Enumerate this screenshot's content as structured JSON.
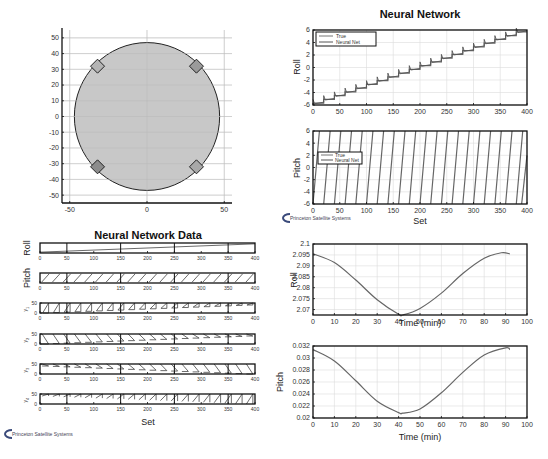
{
  "chart_data": [
    {
      "type": "scatter",
      "title": "",
      "xlabel": "",
      "ylabel": "",
      "xlim": [
        -55,
        55
      ],
      "ylim": [
        -55,
        55
      ],
      "xticks": [
        -50,
        0,
        50
      ],
      "yticks": [
        50,
        40,
        30,
        20,
        10,
        0,
        -10,
        -20,
        -30,
        -40,
        -50
      ],
      "grid": true,
      "shapes": {
        "circle": {
          "center": [
            0,
            0
          ],
          "radius": 47,
          "fill": "#c8c8c8"
        },
        "diamonds": [
          {
            "x": -32,
            "y": 32,
            "fill": "#b4b4b4"
          },
          {
            "x": 32,
            "y": 32,
            "fill": "#9a9a9a"
          },
          {
            "x": -32,
            "y": -32,
            "fill": "#8c8c8c"
          },
          {
            "x": 32,
            "y": -32,
            "fill": "#a8a8a8"
          }
        ]
      }
    },
    {
      "type": "line",
      "title": "Neural Network",
      "xlabel": "",
      "ylabel": "Roll",
      "xlim": [
        0,
        400
      ],
      "ylim": [
        -6,
        6
      ],
      "xticks": [
        0,
        50,
        100,
        150,
        200,
        250,
        300,
        350,
        400
      ],
      "yticks": [
        6,
        4,
        2,
        0,
        -2,
        -4,
        -6
      ],
      "legend": [
        "True",
        "Neural Net"
      ],
      "legend_position": "upper-left",
      "grid": true,
      "series": [
        {
          "name": "True",
          "x": [
            0,
            400
          ],
          "values": [
            -6,
            6
          ],
          "shape": "staircase, step every 20 sets"
        },
        {
          "name": "Neural Net",
          "x": [
            0,
            400
          ],
          "values": [
            -6,
            6
          ],
          "shape": "staircase with small spikes"
        }
      ]
    },
    {
      "type": "line",
      "title": "",
      "xlabel": "Set",
      "ylabel": "Pitch",
      "xlim": [
        0,
        400
      ],
      "ylim": [
        -6,
        6
      ],
      "xticks": [
        0,
        50,
        100,
        150,
        200,
        250,
        300,
        350,
        400
      ],
      "yticks": [
        6,
        4,
        2,
        0,
        -2,
        -4,
        -6
      ],
      "legend": [
        "True",
        "Neural Net"
      ],
      "legend_position": "middle-left",
      "grid": true,
      "series": [
        {
          "name": "True",
          "shape": "sawtooth from -6 to 6, period 20 sets"
        },
        {
          "name": "Neural Net",
          "shape": "sawtooth from -6 to 6, period 20 sets"
        }
      ]
    },
    {
      "type": "line",
      "title": "Neural Network Data",
      "xlabel": "Set",
      "subplots": [
        {
          "ylabel": "Roll",
          "xlim": [
            0,
            400
          ],
          "shape": "slow linear ramp"
        },
        {
          "ylabel": "Pitch",
          "xlim": [
            0,
            400
          ],
          "shape": "sawtooth, period 20"
        },
        {
          "ylabel": "y_1",
          "xlim": [
            0,
            400
          ],
          "ylim": [
            0,
            50
          ],
          "yticks": [
            0,
            50
          ],
          "shape": "shrinking rising ramps"
        },
        {
          "ylabel": "y_2",
          "xlim": [
            0,
            400
          ],
          "ylim": [
            0,
            50
          ],
          "yticks": [
            0,
            50
          ],
          "shape": "shrinking falling ramps"
        },
        {
          "ylabel": "y_3",
          "xlim": [
            0,
            400
          ],
          "ylim": [
            0,
            50
          ],
          "yticks": [
            0,
            50
          ],
          "shape": "growing falling ramps"
        },
        {
          "ylabel": "y_4",
          "xlim": [
            0,
            400
          ],
          "ylim": [
            0,
            50
          ],
          "yticks": [
            0,
            50
          ],
          "shape": "growing rising ramps"
        }
      ],
      "xticks": [
        0,
        50,
        100,
        150,
        200,
        250,
        300,
        350,
        400
      ]
    },
    {
      "type": "line",
      "title": "",
      "xlabel": "Time (min)",
      "ylabel": "Roll",
      "xlim": [
        0,
        100
      ],
      "ylim": [
        2.0675,
        2.1
      ],
      "xticks": [
        0,
        10,
        20,
        30,
        40,
        50,
        60,
        70,
        80,
        90,
        100
      ],
      "yticks": [
        2.1,
        2.095,
        2.09,
        2.085,
        2.08,
        2.075,
        2.07
      ],
      "grid": true,
      "series": [
        {
          "name": "Roll",
          "x": [
            0,
            10,
            20,
            30,
            40,
            42,
            50,
            60,
            70,
            80,
            88,
            92
          ],
          "values": [
            2.0955,
            2.0915,
            2.0835,
            2.0745,
            2.0678,
            2.0675,
            2.0705,
            2.0775,
            2.0865,
            2.0935,
            2.096,
            2.0955
          ]
        }
      ]
    },
    {
      "type": "line",
      "title": "",
      "xlabel": "Time (min)",
      "ylabel": "Pitch",
      "xlim": [
        0,
        100
      ],
      "ylim": [
        0.02,
        0.032
      ],
      "xticks": [
        0,
        10,
        20,
        30,
        40,
        50,
        60,
        70,
        80,
        90,
        100
      ],
      "yticks": [
        0.032,
        0.03,
        0.028,
        0.026,
        0.024,
        0.022,
        0.02
      ],
      "grid": true,
      "series": [
        {
          "name": "Pitch",
          "x": [
            0,
            10,
            20,
            30,
            40,
            42,
            50,
            60,
            70,
            80,
            90,
            92
          ],
          "values": [
            0.0314,
            0.0295,
            0.0262,
            0.0228,
            0.0209,
            0.0208,
            0.0215,
            0.0242,
            0.0276,
            0.0305,
            0.0317,
            0.0314
          ]
        }
      ]
    }
  ],
  "labels": {
    "nn_title": "Neural Network",
    "nn_data_title": "Neural Network Data",
    "roll": "Roll",
    "pitch": "Pitch",
    "set": "Set",
    "time": "Time (min)",
    "legend_true": "True",
    "legend_nn": "Neural Net",
    "y1": "y",
    "y2": "y",
    "y3": "y",
    "y4": "y",
    "s1": "1",
    "s2": "2",
    "s3": "3",
    "s4": "4",
    "logo_text": "Princeton Satellite Systems"
  }
}
